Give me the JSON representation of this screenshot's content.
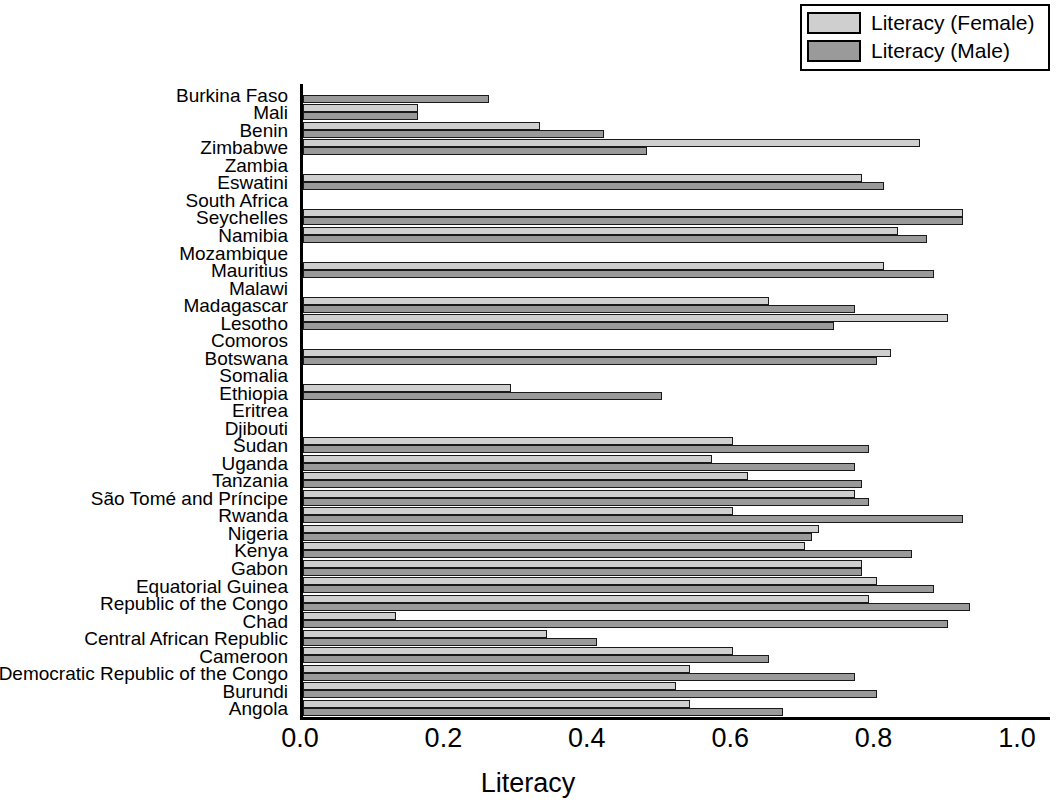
{
  "chart_data": {
    "type": "bar",
    "orientation": "horizontal",
    "title": "",
    "xlabel": "Literacy",
    "ylabel": "",
    "xlim": [
      0.0,
      1.0
    ],
    "xticks": [
      "0.0",
      "0.2",
      "0.4",
      "0.6",
      "0.8",
      "1.0"
    ],
    "xtick_values": [
      0.0,
      0.2,
      0.4,
      0.6,
      0.8,
      1.0
    ],
    "grid": false,
    "legend_position": "top-right",
    "series": [
      {
        "name": "Literacy (Female)",
        "color": "#cfcfcf",
        "values": [
          null,
          0.16,
          0.33,
          0.86,
          null,
          0.78,
          null,
          0.92,
          0.83,
          null,
          0.81,
          null,
          0.65,
          0.9,
          null,
          0.82,
          null,
          0.29,
          null,
          null,
          0.6,
          0.57,
          0.62,
          0.77,
          0.6,
          0.72,
          0.7,
          0.78,
          0.8,
          0.79,
          0.13,
          0.34,
          0.6,
          0.54,
          0.52,
          0.54
        ]
      },
      {
        "name": "Literacy (Male)",
        "color": "#9a9a9a",
        "values": [
          0.26,
          0.16,
          0.42,
          0.48,
          null,
          0.81,
          null,
          0.92,
          0.87,
          null,
          0.88,
          null,
          0.77,
          0.74,
          null,
          0.8,
          null,
          0.5,
          null,
          null,
          0.79,
          0.77,
          0.78,
          0.79,
          0.92,
          0.71,
          0.85,
          0.78,
          0.88,
          0.93,
          0.9,
          0.41,
          0.65,
          0.77,
          0.8,
          0.67
        ]
      }
    ],
    "categories": [
      "Burkina Faso",
      "Mali",
      "Benin",
      "Zimbabwe",
      "Zambia",
      "Eswatini",
      "South Africa",
      "Seychelles",
      "Namibia",
      "Mozambique",
      "Mauritius",
      "Malawi",
      "Madagascar",
      "Lesotho",
      "Comoros",
      "Botswana",
      "Somalia",
      "Ethiopia",
      "Eritrea",
      "Djibouti",
      "Sudan",
      "Uganda",
      "Tanzania",
      "São Tomé and Príncipe",
      "Rwanda",
      "Nigeria",
      "Kenya",
      "Gabon",
      "Equatorial Guinea",
      "Republic of the Congo",
      "Chad",
      "Central African Republic",
      "Cameroon",
      "Democratic Republic of the Congo",
      "Burundi",
      "Angola"
    ]
  },
  "legend": {
    "items": [
      {
        "label": "Literacy (Female)",
        "color": "#cfcfcf"
      },
      {
        "label": "Literacy (Male)",
        "color": "#9a9a9a"
      }
    ]
  },
  "axes": {
    "x_title": "Literacy",
    "x_ticks": [
      "0.0",
      "0.2",
      "0.4",
      "0.6",
      "0.8",
      "1.0"
    ]
  }
}
